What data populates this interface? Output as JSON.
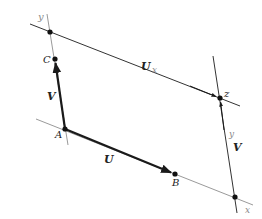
{
  "diagram": {
    "title": "",
    "type": "vector parallelogram diagram",
    "colors": {
      "axis_gray": "#9a9a9a",
      "line_dark": "#333333",
      "vector": "#1a1a1a",
      "point": "#111111",
      "label": "#222222"
    },
    "points": {
      "A": {
        "label": "A",
        "x": 65,
        "y": 129
      },
      "B": {
        "label": "B",
        "x": 175,
        "y": 174
      },
      "C": {
        "label": "C",
        "x": 55,
        "y": 59
      },
      "Z": {
        "label": "z",
        "x": 220,
        "y": 98
      },
      "top_left_intersection": {
        "x": 50,
        "y": 32
      },
      "bottom_right_intersection": {
        "x": 235,
        "y": 197
      }
    },
    "labels": {
      "point_A": "A",
      "point_B": "B",
      "point_C": "C",
      "point_Z": "z",
      "vector_U_bottom": "U",
      "vector_U_top": "U",
      "vector_U_top_subscript": "x",
      "vector_V_left": "V",
      "vector_V_right": "V",
      "axis_y_top_left": "y",
      "axis_y_right": "y",
      "axis_x_bottom_right": "x"
    },
    "vectors": [
      {
        "name": "U",
        "from": "A",
        "to": "B"
      },
      {
        "name": "V",
        "from": "A",
        "to": "C"
      },
      {
        "name": "U x",
        "from": "top_left_intersection",
        "to": "Z"
      },
      {
        "name": "V",
        "from": "bottom_right_intersection",
        "to": "Z"
      }
    ]
  }
}
